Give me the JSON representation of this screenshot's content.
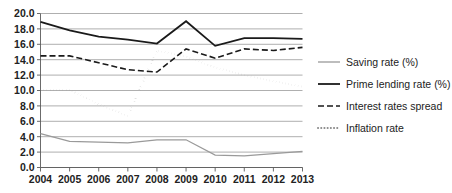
{
  "chart_data": {
    "type": "line",
    "title": "",
    "xlabel": "",
    "ylabel": "",
    "x": [
      2004,
      2005,
      2006,
      2007,
      2008,
      2009,
      2010,
      2011,
      2012,
      2013
    ],
    "categories": [
      "2004",
      "2005",
      "2006",
      "2007",
      "2008",
      "2009",
      "2010",
      "2011",
      "2012",
      "2013"
    ],
    "ylim": [
      0.0,
      20.0
    ],
    "ytick_labels": [
      "0.0",
      "2.0",
      "4.0",
      "6.0",
      "8.0",
      "10.0",
      "12.0",
      "14.0",
      "16.0",
      "18.0",
      "20.0"
    ],
    "ytick_values": [
      0.0,
      2.0,
      4.0,
      6.0,
      8.0,
      10.0,
      12.0,
      14.0,
      16.0,
      18.0,
      20.0
    ],
    "grid": true,
    "grid_axis": "y",
    "legend_position": "right",
    "series": [
      {
        "name": "Saving rate (%)",
        "style": "solid",
        "color": "#9a9a9a",
        "width": 1.3,
        "values": [
          4.4,
          3.4,
          3.3,
          3.2,
          3.6,
          3.6,
          1.6,
          1.5,
          1.8,
          2.1
        ]
      },
      {
        "name": "Prime lending rate (%)",
        "style": "solid",
        "color": "#1a1a1a",
        "width": 1.8,
        "values": [
          18.9,
          17.8,
          17.0,
          16.6,
          16.1,
          19.0,
          15.8,
          16.8,
          16.8,
          16.7
        ]
      },
      {
        "name": "Interest rates spread",
        "style": "dashed",
        "color": "#1a1a1a",
        "width": 1.6,
        "values": [
          14.5,
          14.5,
          13.6,
          12.7,
          12.4,
          15.4,
          14.2,
          15.4,
          15.2,
          15.6
        ]
      },
      {
        "name": "Inflation rate",
        "style": "dotted",
        "color": "#8a8a8a",
        "width": 2.0,
        "values": [
          10.1,
          10.1,
          8.2,
          6.7,
          15.2,
          14.4,
          13.0,
          12.0,
          11.2,
          10.5
        ]
      }
    ]
  },
  "legend": {
    "items": [
      {
        "label": "Saving rate (%)"
      },
      {
        "label": "Prime lending rate (%)"
      },
      {
        "label": "Interest rates spread"
      },
      {
        "label": "Inflation rate"
      }
    ]
  }
}
